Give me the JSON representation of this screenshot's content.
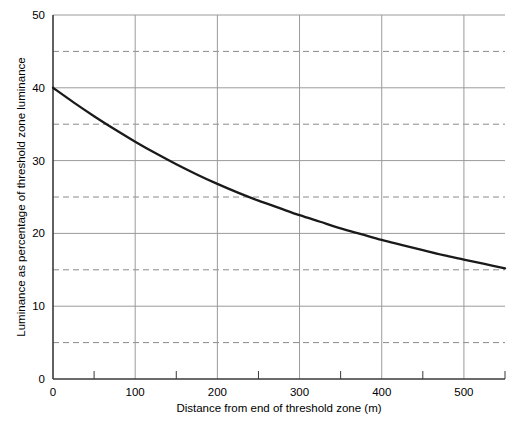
{
  "chart_data": {
    "type": "line",
    "title": "",
    "subtitle": "",
    "xlabel": "Distance from end of threshold zone (m)",
    "ylabel": "Luminance as percentage of threshold zone luminance",
    "xlim": [
      0,
      550
    ],
    "ylim": [
      0,
      50
    ],
    "grid": true,
    "legend": "none",
    "x_major_ticks": [
      0,
      100,
      200,
      300,
      400,
      500
    ],
    "x_major_tick_labels": [
      "0",
      "100",
      "200",
      "300",
      "400",
      "500"
    ],
    "x_minor_ticks": [
      50,
      150,
      250,
      350,
      450,
      550
    ],
    "y_major_ticks": [
      0,
      10,
      20,
      30,
      40,
      50
    ],
    "y_major_tick_labels": [
      "0",
      "10",
      "20",
      "30",
      "40",
      "50"
    ],
    "y_minor_dashed_gridlines": [
      5,
      15,
      25,
      35,
      45
    ],
    "series": [
      {
        "name": "Luminance decay",
        "style": "solid",
        "color": "#1a1a1a",
        "x": [
          0,
          25,
          50,
          75,
          100,
          125,
          150,
          175,
          200,
          225,
          250,
          275,
          300,
          325,
          350,
          375,
          400,
          425,
          450,
          475,
          500,
          525,
          550
        ],
        "values": [
          40.0,
          38.0,
          36.1,
          34.3,
          32.6,
          31.0,
          29.5,
          28.1,
          26.8,
          25.6,
          24.5,
          23.5,
          22.5,
          21.6,
          20.7,
          19.9,
          19.1,
          18.4,
          17.7,
          17.0,
          16.4,
          15.8,
          15.2
        ]
      }
    ],
    "colors": {
      "curve": "#1a1a1a",
      "axis": "#3a3a3a",
      "major_gridline": "#9a9a9a",
      "minor_gridline": "#8a8a8a",
      "background": "#ffffff",
      "text": "#000000"
    }
  }
}
